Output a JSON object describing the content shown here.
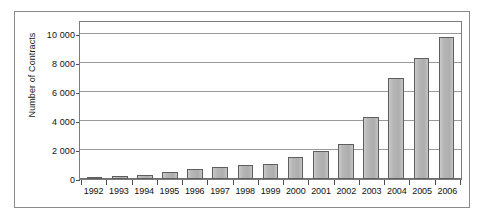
{
  "chart_data": {
    "type": "bar",
    "title": "",
    "xlabel": "",
    "ylabel": "Number of Contracts",
    "categories": [
      "1992",
      "1993",
      "1994",
      "1995",
      "1996",
      "1997",
      "1998",
      "1999",
      "2000",
      "2001",
      "2002",
      "2003",
      "2004",
      "2005",
      "2006"
    ],
    "values": [
      150,
      200,
      250,
      500,
      700,
      800,
      950,
      1050,
      1500,
      1950,
      2450,
      4300,
      7000,
      8400,
      9800
    ],
    "ylim": [
      0,
      11000
    ],
    "y_ticks": [
      0,
      2000,
      4000,
      6000,
      8000,
      10000
    ],
    "y_tick_labels": [
      "0",
      "2 000",
      "4 000",
      "6 000",
      "8 000",
      "10 000"
    ],
    "grid": true,
    "legend": "none",
    "series": [
      {
        "name": "Number of Contracts",
        "values": [
          150,
          200,
          250,
          500,
          700,
          800,
          950,
          1050,
          1500,
          1950,
          2450,
          4300,
          7000,
          8400,
          9800
        ]
      }
    ],
    "colors": {
      "bar_fill": "#b3b3b3",
      "bar_border": "#5e5e5e",
      "gridline": "#9a9a9a",
      "axis": "#7d7d7d",
      "text": "#111111",
      "frame": "#8a8a8a",
      "background": "#ffffff"
    }
  }
}
